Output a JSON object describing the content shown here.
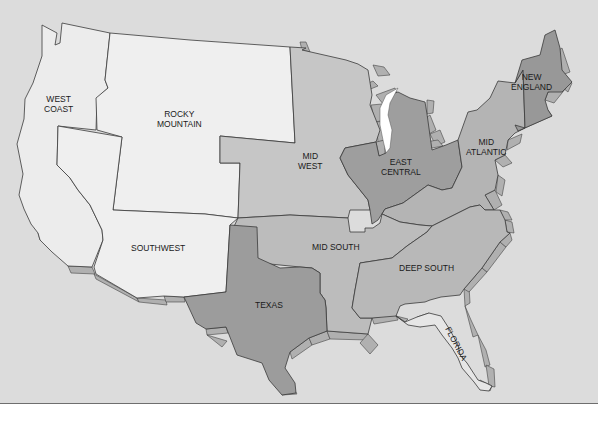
{
  "map": {
    "title": "U.S. Regions",
    "colors": {
      "background": "#dcdcdc",
      "light_region": "#ececec",
      "medium_region": "#bdbdbd",
      "dark_region": "#9a9a9a",
      "edge_shadow": "#b0b0b0",
      "lake": "#ffffff"
    },
    "regions": [
      {
        "id": "west-coast",
        "label": "WEST\nCOAST",
        "shade": "light"
      },
      {
        "id": "rocky-mountain",
        "label": "ROCKY\nMOUNTAIN",
        "shade": "light"
      },
      {
        "id": "southwest",
        "label": "SOUTHWEST",
        "shade": "light"
      },
      {
        "id": "mid-west",
        "label": "MID\nWEST",
        "shade": "medium"
      },
      {
        "id": "east-central",
        "label": "EAST\nCENTRAL",
        "shade": "dark"
      },
      {
        "id": "mid-atlantic",
        "label": "MID\nATLANTIC",
        "shade": "medium"
      },
      {
        "id": "new-england",
        "label": "NEW\nENGLAND",
        "shade": "dark"
      },
      {
        "id": "mid-south",
        "label": "MID SOUTH",
        "shade": "medium"
      },
      {
        "id": "texas",
        "label": "TEXAS",
        "shade": "dark"
      },
      {
        "id": "deep-south",
        "label": "DEEP SOUTH",
        "shade": "medium"
      },
      {
        "id": "florida",
        "label": "FLORIDA",
        "shade": "light"
      }
    ]
  }
}
